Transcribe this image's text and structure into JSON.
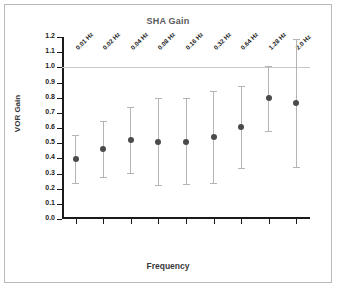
{
  "chart_data": {
    "type": "scatter",
    "title": "SHA Gain",
    "xlabel": "Frequency",
    "ylabel": "VOR Gain",
    "categories": [
      "0.01 Hz",
      "0.02 Hz",
      "0.04 Hz",
      "0.08 Hz",
      "0.16 Hz",
      "0.32 Hz",
      "0.64 Hz",
      "1.28 Hz",
      "2.0 Hz"
    ],
    "values": [
      0.395,
      0.46,
      0.52,
      0.51,
      0.51,
      0.54,
      0.605,
      0.795,
      0.765
    ],
    "error_lower": [
      0.235,
      0.28,
      0.305,
      0.225,
      0.23,
      0.24,
      0.335,
      0.58,
      0.34
    ],
    "error_upper": [
      0.555,
      0.645,
      0.74,
      0.795,
      0.795,
      0.845,
      0.875,
      1.01,
      1.19
    ],
    "ylim": [
      0.0,
      1.2
    ],
    "ytick_labels": [
      "0.0",
      "0.1",
      "0.2",
      "0.3",
      "0.4",
      "0.5",
      "0.6",
      "0.7",
      "0.8",
      "0.9",
      "1.0",
      "1.1",
      "1.2"
    ],
    "ytick_values": [
      0.0,
      0.1,
      0.2,
      0.3,
      0.4,
      0.5,
      0.6,
      0.7,
      0.8,
      0.9,
      1.0,
      1.1,
      1.2
    ],
    "grid": false,
    "legend": "none",
    "reference_line": 1.0,
    "marker_color": "#4a4a4a",
    "errorbar_color": "#b4b4b4",
    "reference_line_color": "#c8c8c8",
    "axis_color": "#1b1b1b",
    "background_color": "#ffffff",
    "frame_border_color": "#b9b9b9"
  }
}
